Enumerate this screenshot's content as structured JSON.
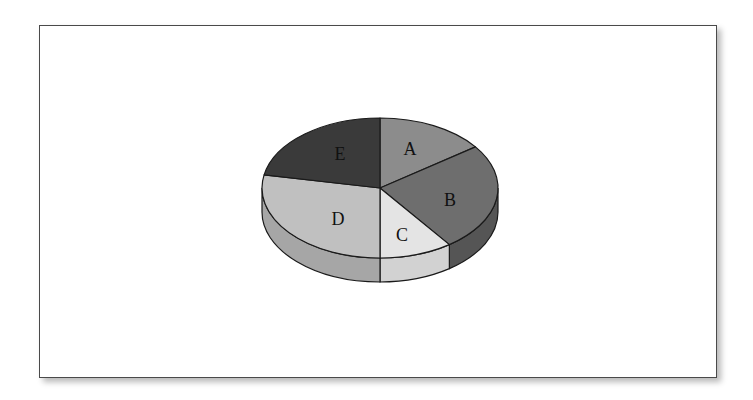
{
  "chart_data": {
    "type": "pie",
    "style": "3d-pie",
    "title": "",
    "legend": false,
    "categories": [
      "A",
      "B",
      "C",
      "D",
      "E"
    ],
    "values": [
      15,
      25,
      10,
      28,
      22
    ],
    "unit": "%",
    "start_angle_deg": 0,
    "direction": "clockwise",
    "colors": {
      "A": "#8c8c8c",
      "B": "#6e6e6e",
      "C": "#e4e4e4",
      "D": "#c0c0c0",
      "E": "#3a3a3a"
    },
    "side_colors": {
      "A": "#727272",
      "B": "#555555",
      "C": "#d2d2d2",
      "D": "#a6a6a6",
      "E": "#2a2a2a"
    },
    "geometry": {
      "cx": 380,
      "cy": 188,
      "rx": 118,
      "ry": 70,
      "depth": 24
    }
  },
  "labels": {
    "A": "A",
    "B": "B",
    "C": "C",
    "D": "D",
    "E": "E"
  }
}
